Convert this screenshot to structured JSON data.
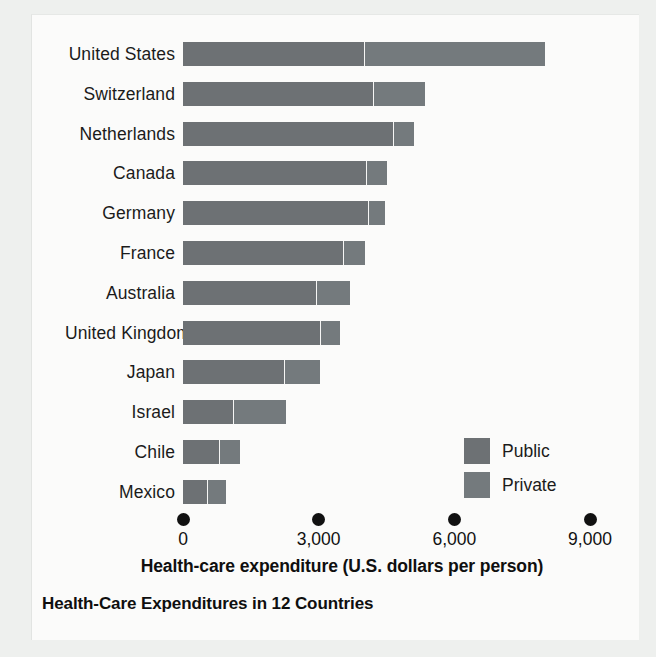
{
  "chart_data": {
    "type": "bar",
    "orientation": "horizontal",
    "stacked": true,
    "title": "Health-Care Expenditures in 12 Countries",
    "xlabel": "Health-care expenditure (U.S. dollars per person)",
    "ylabel": "",
    "xlim": [
      0,
      9600
    ],
    "xticks": [
      0,
      3000,
      6000,
      9000
    ],
    "xtick_labels": [
      "0",
      "3,000",
      "6,000",
      "9,000"
    ],
    "grid": false,
    "legend_position": "inside-right-lower",
    "categories": [
      "United States",
      "Switzerland",
      "Netherlands",
      "Canada",
      "Germany",
      "France",
      "Australia",
      "United Kingdom",
      "Japan",
      "Israel",
      "Chile",
      "Mexico"
    ],
    "series": [
      {
        "name": "Public",
        "color": "#6d7174",
        "values": [
          4000,
          4200,
          4650,
          4050,
          4080,
          3530,
          2950,
          3020,
          2230,
          1100,
          800,
          530
        ]
      },
      {
        "name": "Private",
        "color": "#747a7d",
        "values": [
          4000,
          1150,
          450,
          450,
          390,
          500,
          750,
          460,
          800,
          1170,
          460,
          410
        ]
      }
    ],
    "totals": [
      8000,
      5350,
      5100,
      4500,
      4470,
      4030,
      3700,
      3480,
      3030,
      2270,
      1260,
      940
    ]
  },
  "axis": {
    "title": "Health-care expenditure (U.S. dollars per person)",
    "ticks": [
      {
        "value": "0",
        "pos": 0
      },
      {
        "value": "3,000",
        "pos": 3000
      },
      {
        "value": "6,000",
        "pos": 6000
      },
      {
        "value": "9,000",
        "pos": 9000
      }
    ]
  },
  "legend": {
    "items": [
      {
        "label": "Public",
        "swatch": "#6d7174"
      },
      {
        "label": "Private",
        "swatch": "#747a7d"
      }
    ]
  },
  "caption": {
    "text": "Health-Care Expenditures in 12 Countries"
  }
}
